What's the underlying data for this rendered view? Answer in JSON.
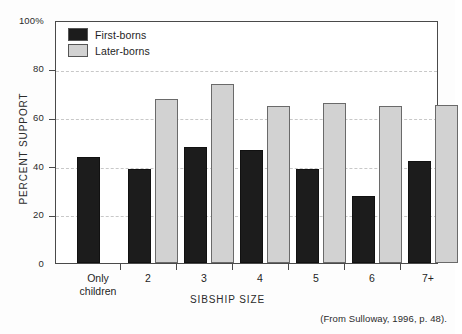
{
  "chart_data": {
    "type": "bar",
    "title": "",
    "xlabel": "SIBSHIP SIZE",
    "ylabel": "PERCENT SUPPORT",
    "ylim": [
      0,
      100
    ],
    "yticks": [
      0,
      20,
      40,
      60,
      80,
      100
    ],
    "ytick_labels": [
      "0",
      "20",
      "40",
      "60",
      "80",
      "100%"
    ],
    "grid": true,
    "legend_position": "top-left",
    "categories": [
      "Only children",
      "2",
      "3",
      "4",
      "5",
      "6",
      "7+"
    ],
    "category_lines": [
      [
        "Only",
        "children"
      ],
      [
        "2"
      ],
      [
        "3"
      ],
      [
        "4"
      ],
      [
        "5"
      ],
      [
        "6"
      ],
      [
        "7+"
      ]
    ],
    "series": [
      {
        "name": "First-borns",
        "color": "#1c1c1c",
        "values": [
          44,
          39,
          48,
          47,
          39,
          28,
          42.5
        ]
      },
      {
        "name": "Later-borns",
        "color": "#d2d2d2",
        "values": [
          null,
          68,
          74.5,
          65,
          66.5,
          65,
          65.5
        ]
      }
    ],
    "annotations": [
      "(From Sulloway, 1996, p. 48)."
    ]
  },
  "legend": {
    "items": [
      {
        "label": "First-borns",
        "swatch": "#1c1c1c"
      },
      {
        "label": "Later-borns",
        "swatch": "#d2d2d2"
      }
    ]
  },
  "axes": {
    "y_title": "PERCENT SUPPORT",
    "x_title": "SIBSHIP SIZE",
    "y_labels": [
      "100%",
      "80",
      "60",
      "40",
      "20",
      "0"
    ]
  },
  "source_note": "(From Sulloway, 1996, p. 48)."
}
